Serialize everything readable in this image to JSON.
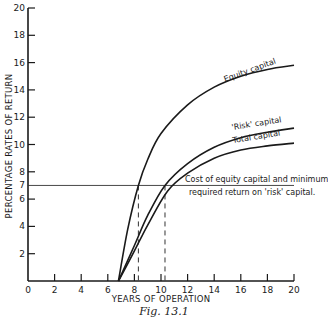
{
  "chart_data": {
    "type": "line",
    "title": "",
    "caption": "Fig. 13.1",
    "xlabel": "YEARS OF OPERATION",
    "ylabel": "PERCENTAGE RATES OF RETURN",
    "xlim": [
      0,
      20
    ],
    "ylim": [
      0,
      20
    ],
    "x_ticks": [
      0,
      2,
      4,
      6,
      8,
      10,
      12,
      14,
      16,
      18,
      20
    ],
    "y_ticks": [
      2,
      4,
      6,
      7,
      8,
      10,
      12,
      14,
      16,
      18,
      20
    ],
    "grid": false,
    "series": [
      {
        "name": "Equity capital",
        "x": [
          6.8,
          7.5,
          8.3,
          9,
          10,
          12,
          14,
          16,
          18,
          20
        ],
        "y": [
          0,
          3.8,
          7,
          8.9,
          10.8,
          12.9,
          14.2,
          15.0,
          15.5,
          15.8
        ]
      },
      {
        "name": "'Risk' capital",
        "x": [
          6.8,
          8,
          9,
          10.3,
          12,
          14,
          16,
          18,
          20
        ],
        "y": [
          0,
          2.6,
          4.8,
          7,
          8.6,
          9.8,
          10.5,
          10.9,
          11.2
        ]
      },
      {
        "name": "Total capital",
        "x": [
          6.8,
          8,
          9,
          10.5,
          12,
          14,
          16,
          18,
          20
        ],
        "y": [
          0,
          2.2,
          4.1,
          6.6,
          7.9,
          9.0,
          9.6,
          9.9,
          10.1
        ]
      }
    ],
    "reference_lines": [
      {
        "type": "horizontal",
        "y": 7,
        "label": "Cost of equity capital and minimum required return on 'risk' capital."
      },
      {
        "type": "vertical-dashed",
        "x": 8.3
      },
      {
        "type": "vertical-dashed",
        "x": 10.3
      }
    ],
    "annotations": [
      "Equity capital",
      "'Risk' capital",
      "Total capital",
      "Cost of equity capital and minimum",
      "required return on 'risk' capital."
    ]
  },
  "labels": {
    "xlabel": "YEARS OF OPERATION",
    "ylabel": "PERCENTAGE RATES OF RETURN",
    "caption": "Fig. 13.1",
    "equity": "Equity capital",
    "risk": "'Risk' capital",
    "total": "Total capital",
    "ref_line1": "Cost of equity capital and minimum",
    "ref_line2": "required return on 'risk' capital."
  }
}
